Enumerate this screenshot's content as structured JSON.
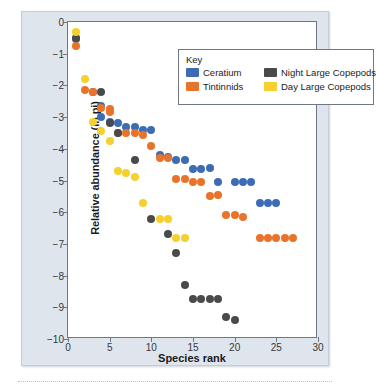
{
  "figure": {
    "legend_title": "Key"
  },
  "chart_data": {
    "type": "scatter",
    "title": "",
    "xlabel": "Species rank",
    "ylabel": "Relative abundance (ln pi)",
    "xlim": [
      0,
      30
    ],
    "ylim": [
      -10,
      0
    ],
    "xticks": [
      0,
      5,
      10,
      15,
      20,
      25,
      30
    ],
    "xticklabels": [
      "0",
      "5",
      "10",
      "15",
      "20",
      "25",
      "30"
    ],
    "yticks": [
      0,
      -1,
      -2,
      -3,
      -4,
      -5,
      -6,
      -7,
      -8,
      -9,
      -10
    ],
    "yticklabels": [
      "0",
      "−1",
      "−2",
      "−3",
      "−4",
      "−5",
      "−6",
      "−7",
      "−8",
      "−9",
      "−10"
    ],
    "grid": false,
    "legend_position": "upper-center",
    "colors": {
      "ceratium": "#3d6cb5",
      "tintinnids": "#e8732a",
      "night_large_copepods": "#4a4a4a",
      "day_large_copepods": "#f5d02e"
    },
    "series": [
      {
        "name": "Ceratium",
        "color": "#3d6cb5",
        "x": [
          1,
          3,
          4,
          4,
          5,
          6,
          7,
          8,
          9,
          10,
          11,
          12,
          13,
          14,
          15,
          16,
          17,
          18,
          20,
          21,
          22,
          23,
          24,
          25
        ],
        "y": [
          -0.55,
          -2.2,
          -2.65,
          -3.0,
          -3.15,
          -3.2,
          -3.3,
          -3.3,
          -3.4,
          -3.4,
          -4.2,
          -4.25,
          -4.35,
          -4.35,
          -4.65,
          -4.65,
          -4.6,
          -5.05,
          -5.05,
          -5.05,
          -5.05,
          -5.7,
          -5.7,
          -5.7
        ]
      },
      {
        "name": "Tintinnids",
        "color": "#e8732a",
        "x": [
          1,
          2,
          3,
          4,
          5,
          5,
          6,
          7,
          8,
          9,
          10,
          11,
          12,
          13,
          14,
          15,
          16,
          17,
          18,
          19,
          20,
          21,
          23,
          24,
          25,
          26,
          27
        ],
        "y": [
          -0.75,
          -2.15,
          -2.2,
          -2.7,
          -2.75,
          -2.85,
          -3.5,
          -3.5,
          -3.5,
          -3.55,
          -3.9,
          -4.3,
          -4.3,
          -4.95,
          -4.95,
          -5.05,
          -5.05,
          -5.5,
          -5.45,
          -6.1,
          -6.1,
          -6.15,
          -6.8,
          -6.8,
          -6.8,
          -6.8,
          -6.8
        ]
      },
      {
        "name": "Night Large Copepods",
        "color": "#4a4a4a",
        "x": [
          1,
          4,
          5,
          6,
          8,
          10,
          12,
          13,
          14,
          15,
          16,
          17,
          18,
          19,
          20
        ],
        "y": [
          -0.5,
          -2.2,
          -3.2,
          -3.5,
          -4.35,
          -6.2,
          -6.7,
          -7.3,
          -8.3,
          -8.75,
          -8.75,
          -8.75,
          -8.75,
          -9.3,
          -9.4
        ]
      },
      {
        "name": "Day Large Copepods",
        "color": "#f5d02e",
        "x": [
          1,
          2,
          3,
          4,
          5,
          6,
          7,
          8,
          9,
          11,
          12,
          13,
          14
        ],
        "y": [
          -0.3,
          -1.8,
          -3.15,
          -3.45,
          -3.75,
          -4.7,
          -4.75,
          -4.9,
          -5.7,
          -6.2,
          -6.2,
          -6.8,
          -6.8
        ]
      }
    ]
  }
}
